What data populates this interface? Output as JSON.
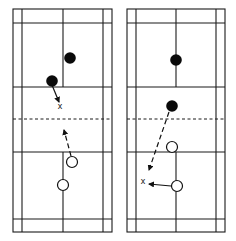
{
  "diagram": {
    "type": "badminton-court-positioning",
    "panels": [
      {
        "id": "left",
        "court": {
          "x_outer_left": 13,
          "x_inner_left": 22,
          "x_center": 63,
          "x_inner_right": 103,
          "x_outer_right": 112,
          "y_top": 9,
          "y_back_service_top": 23,
          "y_short_service_top": 87,
          "y_net": 119,
          "y_short_service_bottom": 152,
          "y_back_service_bottom": 219,
          "y_bottom": 232
        },
        "filled_players": [
          {
            "x": 70,
            "y": 58
          },
          {
            "x": 52,
            "y": 81
          }
        ],
        "open_players": [
          {
            "x": 72,
            "y": 162
          },
          {
            "x": 63,
            "y": 185
          }
        ],
        "x_markers": [
          {
            "x": 60,
            "y": 106,
            "label": "x"
          }
        ],
        "movements": [
          {
            "style": "solid",
            "from": [
              52,
              85
            ],
            "to": [
              59,
              102
            ]
          },
          {
            "style": "dashed",
            "from": [
              71,
              156
            ],
            "to": [
              64,
              130
            ]
          }
        ]
      },
      {
        "id": "right",
        "court": {
          "x_outer_left": 127,
          "x_inner_left": 136,
          "x_center": 176,
          "x_inner_right": 216,
          "x_outer_right": 225,
          "y_top": 9,
          "y_back_service_top": 23,
          "y_short_service_top": 87,
          "y_net": 119,
          "y_short_service_bottom": 152,
          "y_back_service_bottom": 219,
          "y_bottom": 232
        },
        "filled_players": [
          {
            "x": 176,
            "y": 60
          },
          {
            "x": 172,
            "y": 106
          }
        ],
        "open_players": [
          {
            "x": 172,
            "y": 147
          },
          {
            "x": 177,
            "y": 186
          }
        ],
        "x_markers": [
          {
            "x": 143,
            "y": 181,
            "label": "x"
          }
        ],
        "movements": [
          {
            "style": "dashed",
            "from": [
              169,
              112
            ],
            "to": [
              149,
              170
            ]
          },
          {
            "style": "solid",
            "from": [
              171,
              186
            ],
            "to": [
              149,
              184
            ]
          }
        ]
      }
    ],
    "colors": {
      "line": "#1a1a1a",
      "player_filled": "#0a0a0a",
      "background": "#ffffff"
    }
  }
}
